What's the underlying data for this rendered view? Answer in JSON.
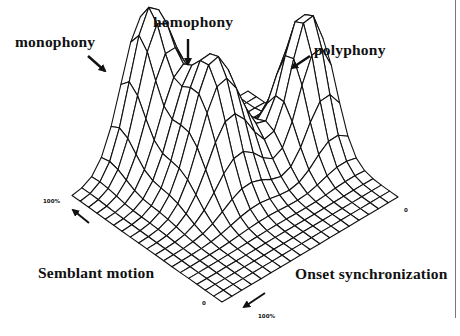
{
  "chart_data": {
    "type": "surface-3d-wireframe",
    "title": "",
    "peaks": [
      {
        "name": "monophony",
        "semblant_motion": 0.88,
        "onset_synchronization": 0.92,
        "height": 1.0
      },
      {
        "name": "homophony",
        "semblant_motion": 0.62,
        "onset_synchronization": 0.88,
        "height": 0.87
      },
      {
        "name": "polyphony",
        "semblant_motion": 0.15,
        "onset_synchronization": 0.72,
        "height": 0.93
      }
    ],
    "axes": {
      "x": {
        "label": "Onset synchronization",
        "range": [
          "0",
          "100%"
        ]
      },
      "y": {
        "label": "Semblant motion",
        "range": [
          "0",
          "100%"
        ]
      },
      "z": {
        "label": "",
        "range": [
          0,
          1
        ]
      }
    },
    "grid": {
      "rows": 19,
      "cols": 19
    },
    "legend": null,
    "annotations": [
      "monophony",
      "homophony",
      "polyphony"
    ]
  },
  "labels": {
    "monophony": "monophony",
    "homophony": "homophony",
    "polyphony": "polyphony",
    "semblant_motion": "Semblant motion",
    "onset_synchronization": "Onset synchronization",
    "tick_left_100": "100%",
    "tick_bottom_0": "0",
    "tick_bottom_100": "100%",
    "tick_right_0": "0"
  },
  "colors": {
    "line": "#111111",
    "background": "#ffffff",
    "rule": "#777777"
  }
}
